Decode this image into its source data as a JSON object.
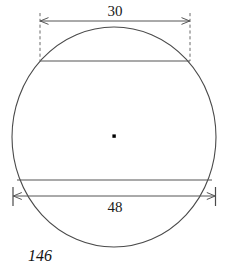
{
  "figure": {
    "number_label": "146",
    "shape": "circle",
    "stroke_color": "#4a4a4a",
    "text_color": "#111111",
    "background_color": "#ffffff",
    "center_dot": {
      "name": "circle-center",
      "visible": true,
      "color": "#000000"
    },
    "circle": {
      "cx": 114,
      "cy": 137,
      "rx": 102,
      "ry": 110
    },
    "chords": [
      {
        "name": "upper-chord",
        "x1": 40,
        "x2": 190,
        "y": 61,
        "measure_label": "30"
      },
      {
        "name": "lower-chord",
        "x1": 17,
        "x2": 212,
        "y": 180,
        "measure_label": "48"
      }
    ],
    "dimensions": [
      {
        "name": "upper-dimension",
        "value": "30",
        "label_x": 115,
        "label_y": 16,
        "line_y": 21,
        "x1": 40,
        "x2": 190,
        "arrows": "both",
        "extension_style": "dashed",
        "label_position": "above"
      },
      {
        "name": "lower-dimension",
        "value": "48",
        "label_x": 115,
        "label_y": 212,
        "line_y": 196,
        "x1": 13,
        "x2": 215,
        "arrows": "both",
        "extension_style": "tick",
        "label_position": "below"
      }
    ]
  }
}
